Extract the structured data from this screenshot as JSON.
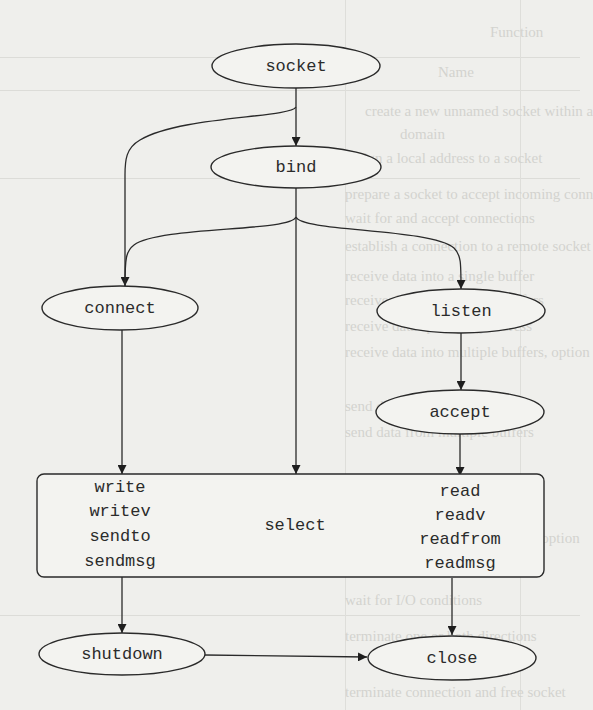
{
  "diagram": {
    "type": "flow",
    "colors": {
      "background": "#efefec",
      "stroke": "#2a2a2a",
      "text": "#2b2b2b"
    },
    "nodes": {
      "socket": {
        "label": "socket",
        "shape": "ellipse"
      },
      "bind": {
        "label": "bind",
        "shape": "ellipse"
      },
      "connect": {
        "label": "connect",
        "shape": "ellipse"
      },
      "listen": {
        "label": "listen",
        "shape": "ellipse"
      },
      "accept": {
        "label": "accept",
        "shape": "ellipse"
      },
      "io_box": {
        "shape": "rounded-rect",
        "write_group": [
          "write",
          "writev",
          "sendto",
          "sendmsg"
        ],
        "select": "select",
        "read_group": [
          "read",
          "readv",
          "readfrom",
          "readmsg"
        ]
      },
      "shutdown": {
        "label": "shutdown",
        "shape": "ellipse"
      },
      "close": {
        "label": "close",
        "shape": "ellipse"
      }
    },
    "edges": [
      {
        "from": "socket",
        "to": "bind"
      },
      {
        "from": "socket",
        "to": "connect"
      },
      {
        "from": "bind",
        "to": "connect"
      },
      {
        "from": "bind",
        "to": "listen"
      },
      {
        "from": "bind",
        "to": "io_box.select"
      },
      {
        "from": "connect",
        "to": "io_box.write_group"
      },
      {
        "from": "listen",
        "to": "accept"
      },
      {
        "from": "accept",
        "to": "io_box.read_group"
      },
      {
        "from": "io_box.write_group",
        "to": "shutdown"
      },
      {
        "from": "io_box.read_group",
        "to": "close"
      },
      {
        "from": "shutdown",
        "to": "close"
      }
    ]
  },
  "bleed_through": {
    "header": [
      "Name",
      "Function"
    ],
    "rows": [
      "create a new unnamed socket within a",
      "domain",
      "assign a local address to a socket",
      "prepare a socket to accept incoming conn",
      "wait for and accept connections",
      "establish a connection to a remote socket",
      "receive data into a single buffer",
      "receive data into multiple buffers",
      "receive data specifying address",
      "receive data into multiple buffers, option",
      "send data from a single buffer",
      "send data from multiple buffers",
      "send data specifying address",
      "send data from multiple buffers, option",
      "wait for I/O conditions",
      "terminate one or both directions",
      "terminate connection and free socket"
    ]
  }
}
